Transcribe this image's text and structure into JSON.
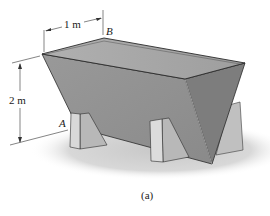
{
  "figure": {
    "caption": "(a)",
    "dimensions": {
      "width_label": "1 m",
      "height_label": "2 m"
    },
    "points": {
      "A": "A",
      "B": "B"
    },
    "colors": {
      "front_face": "#8f8f8f",
      "end_face": "#7b7b7b",
      "water_surface": "#a8a8a8",
      "support": "#c4c4c4",
      "shadow": "#d6d6d6",
      "edge": "#2a2a2a"
    }
  }
}
